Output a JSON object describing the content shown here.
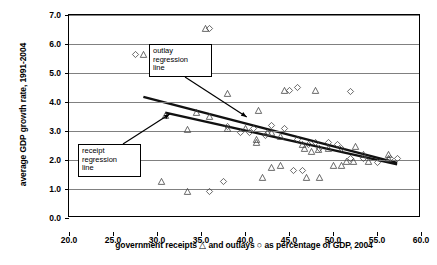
{
  "chart_data": {
    "type": "scatter",
    "title": "",
    "xlabel": "government receipts △ and outlays ○ as percentage of GDP, 2004",
    "ylabel": "average GDP growth rate, 1991-2004",
    "xlim": [
      20.0,
      60.0
    ],
    "ylim": [
      0.0,
      7.0
    ],
    "xticks": [
      "20.0",
      "25.0",
      "30.0",
      "35.0",
      "40.0",
      "45.0",
      "50.0",
      "55.0",
      "60.0"
    ],
    "yticks": [
      "0.0",
      "1.0",
      "2.0",
      "3.0",
      "4.0",
      "5.0",
      "6.0",
      "7.0"
    ],
    "grid": "horizontal",
    "legend_position": "inline-in-axis-label",
    "series": [
      {
        "name": "government receipts",
        "marker": "triangle",
        "points": [
          [
            28.5,
            5.65
          ],
          [
            35.5,
            6.55
          ],
          [
            44.5,
            4.4
          ],
          [
            48.0,
            4.4
          ],
          [
            38.0,
            4.3
          ],
          [
            34.5,
            3.65
          ],
          [
            31.0,
            3.55
          ],
          [
            36.0,
            3.5
          ],
          [
            41.5,
            3.7
          ],
          [
            33.5,
            3.05
          ],
          [
            38.0,
            3.1
          ],
          [
            40.0,
            3.1
          ],
          [
            42.5,
            2.95
          ],
          [
            43.0,
            2.95
          ],
          [
            44.0,
            2.8
          ],
          [
            41.3,
            2.7
          ],
          [
            41.3,
            2.6
          ],
          [
            46.5,
            2.55
          ],
          [
            46.8,
            2.4
          ],
          [
            47.5,
            2.3
          ],
          [
            48.3,
            2.35
          ],
          [
            49.5,
            2.4
          ],
          [
            52.5,
            2.45
          ],
          [
            53.5,
            2.2
          ],
          [
            56.3,
            2.2
          ],
          [
            56.3,
            2.05
          ],
          [
            51.5,
            1.95
          ],
          [
            52.3,
            1.95
          ],
          [
            54.0,
            1.95
          ],
          [
            43.0,
            1.75
          ],
          [
            44.0,
            1.8
          ],
          [
            50.0,
            1.8
          ],
          [
            51.0,
            1.8
          ],
          [
            30.5,
            1.25
          ],
          [
            33.5,
            0.9
          ],
          [
            42.0,
            1.4
          ],
          [
            47.0,
            1.4
          ],
          [
            48.5,
            1.4
          ]
        ]
      },
      {
        "name": "government outlays",
        "marker": "diamond",
        "points": [
          [
            27.5,
            5.65
          ],
          [
            36.0,
            6.55
          ],
          [
            45.0,
            4.4
          ],
          [
            46.0,
            4.5
          ],
          [
            52.0,
            4.35
          ],
          [
            38.0,
            3.15
          ],
          [
            41.0,
            3.1
          ],
          [
            43.0,
            3.2
          ],
          [
            39.5,
            2.95
          ],
          [
            40.5,
            2.95
          ],
          [
            42.3,
            2.85
          ],
          [
            44.5,
            3.1
          ],
          [
            46.0,
            2.7
          ],
          [
            47.2,
            2.55
          ],
          [
            49.5,
            2.6
          ],
          [
            50.5,
            2.55
          ],
          [
            48.5,
            2.4
          ],
          [
            51.0,
            2.4
          ],
          [
            52.0,
            2.05
          ],
          [
            53.5,
            2.05
          ],
          [
            55.0,
            1.9
          ],
          [
            56.5,
            2.05
          ],
          [
            57.3,
            2.05
          ],
          [
            45.5,
            1.65
          ],
          [
            46.5,
            1.65
          ],
          [
            37.5,
            1.25
          ],
          [
            36.0,
            0.9
          ],
          [
            48.0,
            2.6
          ]
        ]
      }
    ],
    "fit_lines": [
      {
        "name": "outlay regression line",
        "x0": 28.5,
        "y0": 4.15,
        "x1": 57.5,
        "y1": 1.85
      },
      {
        "name": "receipt regression line",
        "x0": 31.0,
        "y0": 3.6,
        "x1": 57.5,
        "y1": 1.8
      }
    ],
    "annotations": [
      {
        "id": "outlay",
        "lines": [
          "outlay",
          "regression",
          "line"
        ],
        "target_x": 40.3,
        "target_y": 3.45
      },
      {
        "id": "receipt",
        "lines": [
          "receipt",
          "regression",
          "line"
        ],
        "target_x": 31.6,
        "target_y": 3.55
      }
    ]
  }
}
